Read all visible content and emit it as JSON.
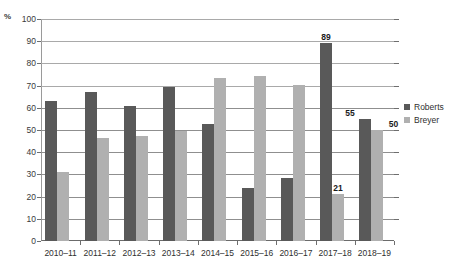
{
  "chart_data": {
    "type": "bar",
    "title": "",
    "subtitle": "",
    "xlabel": "",
    "ylabel": "%",
    "ylim": [
      0,
      100
    ],
    "yticks": [
      0,
      10,
      20,
      30,
      40,
      50,
      60,
      70,
      80,
      90,
      100
    ],
    "grid": true,
    "legend_position": "right",
    "categories": [
      "2010–11",
      "2011–12",
      "2012–13",
      "2013–14",
      "2014–15",
      "2015–16",
      "2016–17",
      "2017–18",
      "2018–19"
    ],
    "series": [
      {
        "name": "Roberts",
        "color": "#595959",
        "values": [
          63,
          67,
          61,
          69.5,
          52.5,
          24,
          28.5,
          89,
          55
        ]
      },
      {
        "name": "Breyer",
        "color": "#b0b0b0",
        "values": [
          31,
          46.5,
          47.5,
          49.5,
          73.5,
          74.5,
          70.5,
          21,
          50
        ]
      }
    ],
    "annotations": [
      {
        "series": "Roberts",
        "category": "2017–18",
        "value": 89,
        "text": "89"
      },
      {
        "series": "Breyer",
        "category": "2017–18",
        "value": 21,
        "text": "21"
      },
      {
        "series": "Roberts",
        "category": "2018–19",
        "value": 55,
        "text": "55"
      },
      {
        "series": "Breyer",
        "category": "2018–19",
        "value": 50,
        "text": "50"
      }
    ]
  },
  "axis": {
    "unit_label": "%",
    "ytick_labels": [
      "100",
      "90",
      "80",
      "70",
      "60",
      "50",
      "40",
      "30",
      "20",
      "10",
      "0"
    ]
  },
  "legend": {
    "items": [
      {
        "label": "Roberts",
        "color": "#595959"
      },
      {
        "label": "Breyer",
        "color": "#b0b0b0"
      }
    ]
  },
  "colors": {
    "roberts": "#595959",
    "breyer": "#b0b0b0",
    "gridline": "#8f8f8f",
    "axis": "#6b6b6b",
    "text": "#2f2f2f"
  }
}
